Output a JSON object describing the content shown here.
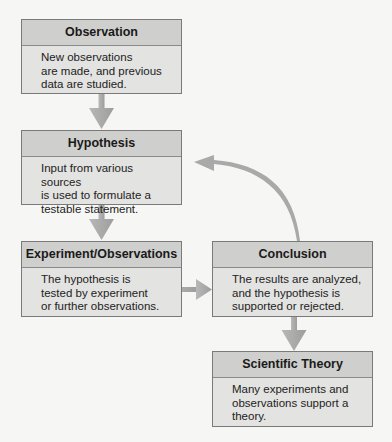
{
  "diagram": {
    "type": "flowchart",
    "nodes": [
      {
        "id": "observation",
        "title": "Observation",
        "text": "New observations\nare made, and previous\ndata are studied."
      },
      {
        "id": "hypothesis",
        "title": "Hypothesis",
        "text": "Input from various sources\nis used to formulate a\ntestable statement."
      },
      {
        "id": "experiment",
        "title": "Experiment/Observations",
        "text": "The hypothesis is\ntested by experiment\nor further observations."
      },
      {
        "id": "conclusion",
        "title": "Conclusion",
        "text": "The results are analyzed,\nand the hypothesis is\nsupported or rejected."
      },
      {
        "id": "theory",
        "title": "Scientific Theory",
        "text": "Many experiments and\nobservations support a\ntheory."
      }
    ],
    "edges": [
      {
        "from": "observation",
        "to": "hypothesis"
      },
      {
        "from": "hypothesis",
        "to": "experiment"
      },
      {
        "from": "experiment",
        "to": "conclusion"
      },
      {
        "from": "conclusion",
        "to": "hypothesis",
        "style": "curved"
      },
      {
        "from": "conclusion",
        "to": "theory"
      }
    ],
    "colors": {
      "header_fill": "#cfcfcd",
      "body_fill": "#e3e3e1",
      "border": "#7a7a7a",
      "arrow": "#a9a9a9",
      "background": "#f6f6f4"
    }
  }
}
